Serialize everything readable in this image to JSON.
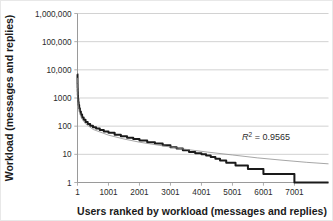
{
  "chart_data": {
    "type": "line",
    "title": "",
    "xlabel": "Users ranked by workload (messages and replies)",
    "ylabel": "Workload (messages and replies)",
    "xscale": "linear",
    "yscale": "log",
    "xlim": [
      1,
      8100
    ],
    "ylim": [
      1,
      1000000
    ],
    "grid": true,
    "grid_axis": "y",
    "legend": null,
    "xticks": [
      1,
      1001,
      2001,
      3001,
      4001,
      5001,
      6001,
      7001
    ],
    "xticklabels": [
      "1",
      "1001",
      "2001",
      "3001",
      "4001",
      "5001",
      "6001",
      "7001"
    ],
    "yticks": [
      1,
      10,
      100,
      1000,
      10000,
      100000,
      1000000
    ],
    "yticklabels": [
      "1",
      "10",
      "100",
      "1000",
      "10,000",
      "100,000",
      "1,000,000"
    ],
    "annotations": [
      {
        "name": "r-squared",
        "prefix": "R",
        "superscript": "2",
        "suffix": " = 0.9565",
        "text": "R² = 0.9565",
        "x": 6600,
        "y": 40
      }
    ],
    "series": [
      {
        "name": "Observed workload",
        "style": "step",
        "color": "#1a1a1a",
        "width": 2.0,
        "points": [
          [
            1,
            7000
          ],
          [
            2,
            4200
          ],
          [
            3,
            3100
          ],
          [
            5,
            2300
          ],
          [
            8,
            1700
          ],
          [
            12,
            1250
          ],
          [
            18,
            950
          ],
          [
            26,
            720
          ],
          [
            38,
            560
          ],
          [
            55,
            430
          ],
          [
            78,
            330
          ],
          [
            110,
            258
          ],
          [
            150,
            205
          ],
          [
            200,
            168
          ],
          [
            260,
            140
          ],
          [
            330,
            120
          ],
          [
            410,
            104
          ],
          [
            500,
            92
          ],
          [
            600,
            82
          ],
          [
            720,
            73
          ],
          [
            850,
            65
          ],
          [
            1001,
            58
          ],
          [
            1200,
            50
          ],
          [
            1400,
            44
          ],
          [
            1600,
            39
          ],
          [
            1800,
            35
          ],
          [
            2001,
            31
          ],
          [
            2250,
            27
          ],
          [
            2500,
            24
          ],
          [
            2750,
            21
          ],
          [
            3001,
            18
          ],
          [
            3200,
            16
          ],
          [
            3400,
            14
          ],
          [
            3600,
            12
          ],
          [
            3800,
            11
          ],
          [
            4001,
            10
          ],
          [
            4150,
            9
          ],
          [
            4300,
            8
          ],
          [
            4450,
            7
          ],
          [
            4600,
            6
          ],
          [
            4800,
            5
          ],
          [
            5100,
            4
          ],
          [
            5500,
            3
          ],
          [
            6000,
            2
          ],
          [
            6900,
            2
          ],
          [
            7000,
            1
          ],
          [
            8100,
            1
          ]
        ]
      },
      {
        "name": "Power-law trendline",
        "style": "smooth",
        "color": "#8f8f8f",
        "width": 0.8,
        "points": [
          [
            1,
            5200
          ],
          [
            2,
            3300
          ],
          [
            4,
            2050
          ],
          [
            8,
            1280
          ],
          [
            16,
            800
          ],
          [
            32,
            500
          ],
          [
            64,
            312
          ],
          [
            128,
            195
          ],
          [
            256,
            122
          ],
          [
            512,
            76
          ],
          [
            1001,
            48
          ],
          [
            1500,
            35
          ],
          [
            2001,
            27
          ],
          [
            2750,
            20
          ],
          [
            3500,
            15
          ],
          [
            4200,
            12
          ],
          [
            5000,
            9.5
          ],
          [
            5800,
            7.5
          ],
          [
            6600,
            6.2
          ],
          [
            7400,
            5.2
          ],
          [
            8100,
            4.6
          ]
        ]
      }
    ]
  },
  "axes": {
    "x_title": "Users ranked by workload (messages and replies)",
    "y_title": "Workload (messages and replies)"
  }
}
